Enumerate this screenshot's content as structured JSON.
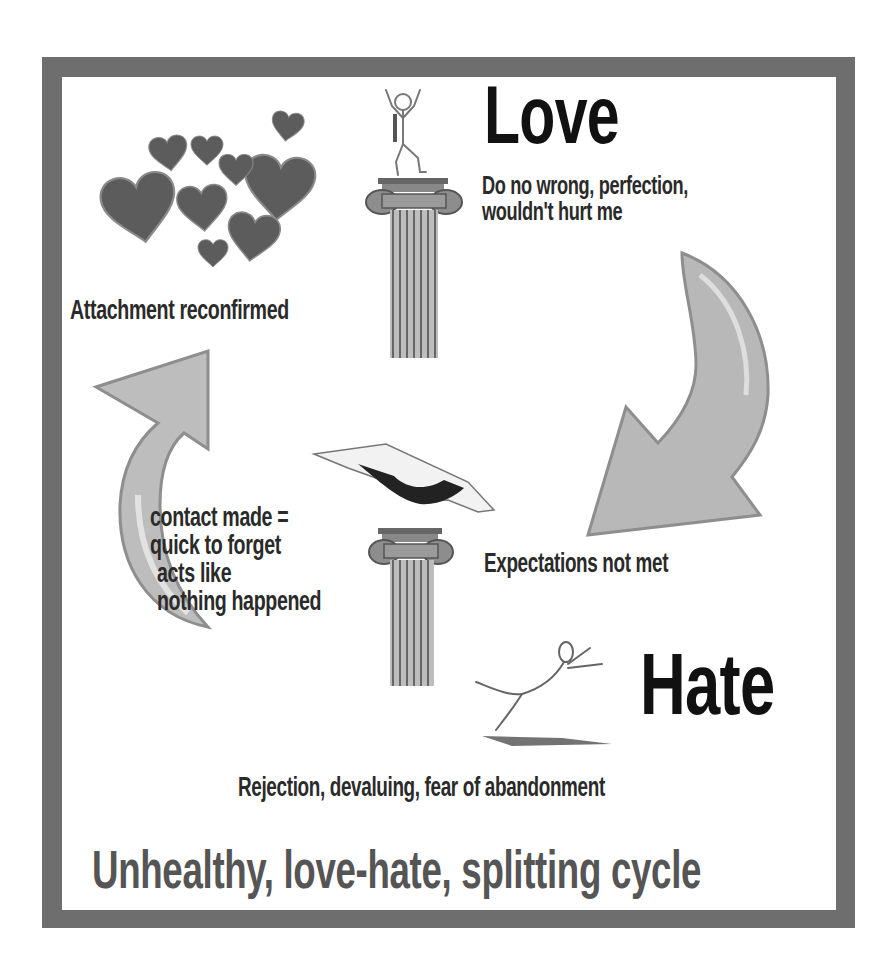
{
  "diagram": {
    "title": "Unhealthy, love-hate, splitting cycle",
    "colors": {
      "frame": "#6e6e6e",
      "panel": "#ffffff",
      "text_dark": "#111111",
      "text_title": "#555555",
      "arrow_fill": "#b8b8b8",
      "heart_fill": "#5a5a5a"
    },
    "nodes": {
      "love": {
        "heading": "Love",
        "description_lines": [
          "Do no wrong, perfection,",
          "wouldn't hurt me"
        ],
        "icon": "stick-figure-on-pillar-icon"
      },
      "expectations": {
        "label": "Expectations not met",
        "icon": "curved-arrow-down-icon"
      },
      "hate": {
        "heading": "Hate",
        "description": "Rejection, devaluing, fear of abandonment",
        "icon": "falling-stick-figure-icon"
      },
      "contact": {
        "lines": [
          "contact made =",
          "quick to forget",
          " acts like",
          "nothing happened"
        ],
        "icon": "pointing-hand-over-pillar-icon"
      },
      "attachment": {
        "label": "Attachment reconfirmed",
        "icon": "hearts-cluster-icon"
      }
    },
    "edges": [
      {
        "from": "love",
        "to": "hate",
        "label": "Expectations not met"
      },
      {
        "from": "hate",
        "to": "contact",
        "label": ""
      },
      {
        "from": "contact",
        "to": "love",
        "label": "Attachment reconfirmed"
      }
    ]
  }
}
